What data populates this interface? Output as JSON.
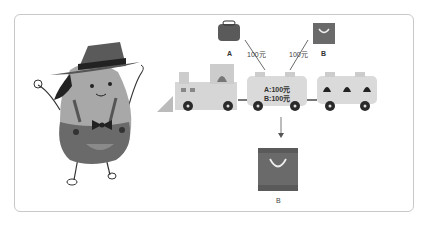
{
  "illustration": {
    "wallet_label": "A",
    "bag_label": "B",
    "price_a": "100元",
    "price_b": "100元",
    "car_line_a": "A:100元",
    "car_line_b": "B:100元",
    "result_label": "B"
  },
  "colors": {
    "border": "#c8c8c8",
    "dark": "#5a5a5a",
    "mid": "#7a7a7a",
    "light": "#d8d8d8",
    "wheel": "#2a2a2a"
  }
}
